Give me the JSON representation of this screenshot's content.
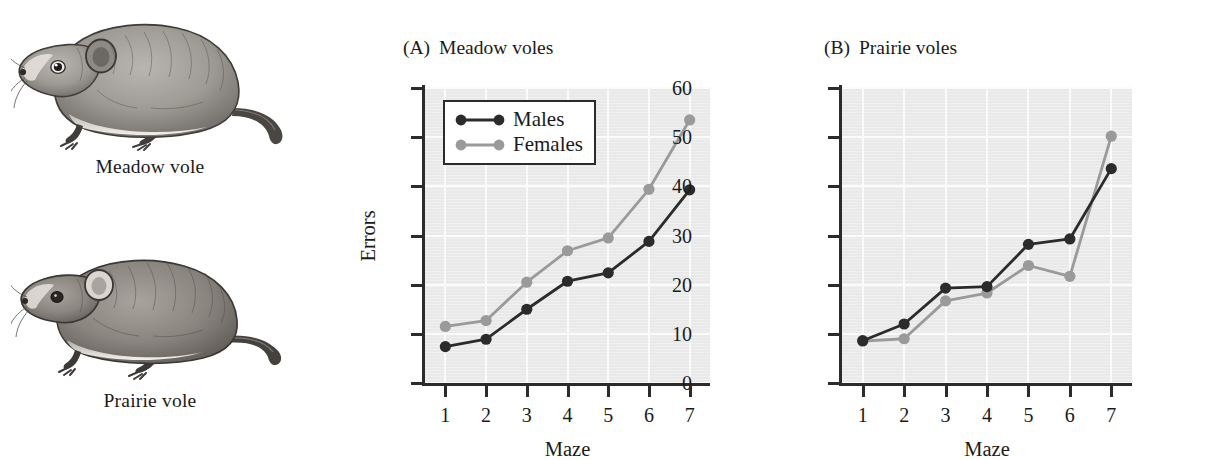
{
  "illustrations": [
    {
      "id": "meadow-vole",
      "caption": "Meadow vole"
    },
    {
      "id": "prairie-vole",
      "caption": "Prairie vole"
    }
  ],
  "panels": [
    {
      "key": "a",
      "letter": "(A)",
      "title": "Meadow voles"
    },
    {
      "key": "b",
      "letter": "(B)",
      "title": "Prairie voles"
    }
  ],
  "legend": {
    "items": [
      {
        "label": "Males",
        "color": "#2b2b2b"
      },
      {
        "label": "Females",
        "color": "#9a9a9a"
      }
    ]
  },
  "colors": {
    "males": "#2b2b2b",
    "females": "#9a9a9a",
    "plot_background": "#e9e9e9",
    "gridline": "#fbfbfb",
    "axis": "#2b2b2b"
  },
  "chart_data": [
    {
      "type": "line",
      "panel": "(A)",
      "title": "Meadow voles",
      "xlabel": "Maze",
      "ylabel": "Errors",
      "categories": [
        1,
        2,
        3,
        4,
        5,
        6,
        7
      ],
      "xticklabels": [
        "1",
        "2",
        "3",
        "4",
        "5",
        "6",
        "7"
      ],
      "yticklabels": [
        "0",
        "10",
        "20",
        "30",
        "40",
        "50",
        "60"
      ],
      "xlim": [
        0.5,
        7.5
      ],
      "ylim": [
        0,
        60
      ],
      "ytick_interval": 10,
      "grid": true,
      "legend_position": "top-left",
      "series": [
        {
          "name": "Males",
          "color": "#2b2b2b",
          "values": [
            7.4,
            8.9,
            15.0,
            20.7,
            22.4,
            28.8,
            39.3
          ]
        },
        {
          "name": "Females",
          "color": "#9a9a9a",
          "values": [
            11.5,
            12.7,
            20.5,
            26.9,
            29.5,
            39.4,
            53.5
          ]
        }
      ]
    },
    {
      "type": "line",
      "panel": "(B)",
      "title": "Prairie voles",
      "xlabel": "Maze",
      "ylabel": "",
      "categories": [
        1,
        2,
        3,
        4,
        5,
        6,
        7
      ],
      "xticklabels": [
        "1",
        "2",
        "3",
        "4",
        "5",
        "6",
        "7"
      ],
      "yticklabels": [
        "",
        "",
        "",
        "",
        "",
        "",
        ""
      ],
      "xlim": [
        0.5,
        7.5
      ],
      "ylim": [
        0,
        60
      ],
      "ytick_interval": 10,
      "grid": true,
      "legend_position": "none",
      "series": [
        {
          "name": "Males",
          "color": "#2b2b2b",
          "values": [
            8.6,
            12.0,
            19.3,
            19.6,
            28.2,
            29.3,
            43.6
          ]
        },
        {
          "name": "Females",
          "color": "#9a9a9a",
          "values": [
            8.5,
            9.0,
            16.7,
            18.3,
            23.9,
            21.7,
            50.2
          ]
        }
      ]
    }
  ]
}
